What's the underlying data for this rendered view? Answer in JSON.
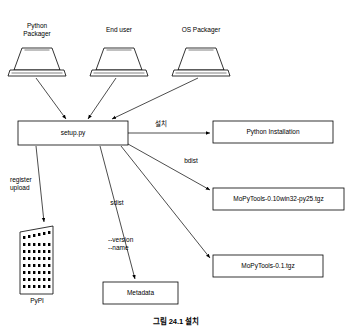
{
  "figure": {
    "caption": "그림 24.1 설치"
  },
  "actors": [
    {
      "name": "python-packager",
      "label": "Python\nPackager",
      "x": 12,
      "y": 22
    },
    {
      "name": "end-user",
      "label": "End user",
      "x": 99,
      "y": 26
    },
    {
      "name": "os-packager",
      "label": "OS Packager",
      "x": 178,
      "y": 26
    }
  ],
  "nodes": [
    {
      "name": "setup-py",
      "label": "setup.py"
    },
    {
      "name": "python-installation",
      "label": "Python Installation"
    },
    {
      "name": "mopytools-win32-tgz",
      "label": "MoPyTools-0.10win32-py25.tgz"
    },
    {
      "name": "mopytools-tgz",
      "label": "MoPyTools-0.1.tgz"
    },
    {
      "name": "metadata",
      "label": "Metadata"
    },
    {
      "name": "pypi",
      "label": "PyPI"
    }
  ],
  "edge_labels": [
    {
      "name": "edge-label-install",
      "label": "설치",
      "x": 152,
      "y": 125
    },
    {
      "name": "edge-label-bdist",
      "label": "bdist",
      "x": 188,
      "y": 161
    },
    {
      "name": "edge-label-sdist",
      "label": "sdist",
      "x": 113,
      "y": 203
    },
    {
      "name": "edge-label-register-upload",
      "label": "register\nupload",
      "x": 16,
      "y": 180
    },
    {
      "name": "edge-label-version-name",
      "label": "--version\n--name",
      "x": 110,
      "y": 240
    }
  ],
  "colors": {
    "stroke": "#000000",
    "background": "#ffffff",
    "pypi_fill": "#ffffff"
  }
}
